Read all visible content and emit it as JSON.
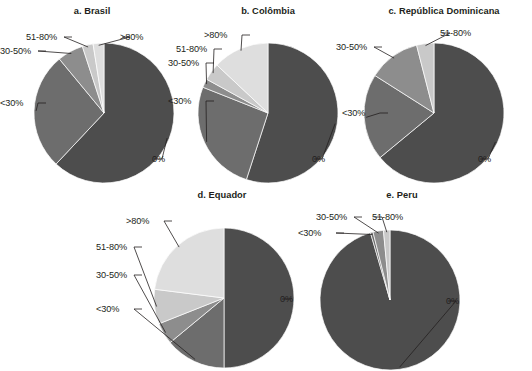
{
  "figure": {
    "cut_title_fragment": "",
    "legend_categories": [
      "0%",
      "<30%",
      "30-50%",
      "51-80%",
      ">80%"
    ],
    "colors": {
      "0%": "#4d4d4d",
      "<30%": "#6d6d6d",
      "30-50%": "#8d8d8d",
      "51-80%": "#c9c9c9",
      ">80%": "#dedede"
    }
  },
  "chart_data": [
    {
      "type": "pie",
      "title": "a. Brasil",
      "categories": [
        "0%",
        "<30%",
        "30-50%",
        "51-80%",
        ">80%"
      ],
      "values": [
        62,
        27,
        6,
        2.5,
        2.5
      ],
      "labels": [
        "0%",
        "<30%",
        "30-50%",
        "51-80%",
        ">80%"
      ],
      "start_angle": 0,
      "direction": "clockwise"
    },
    {
      "type": "pie",
      "title": "b. Colômbia",
      "categories": [
        "0%",
        "<30%",
        "30-50%",
        "51-80%",
        ">80%"
      ],
      "values": [
        55,
        26,
        2,
        4,
        13
      ],
      "labels": [
        "0%",
        "<30%",
        "30-50%",
        "51-80%",
        ">80%"
      ],
      "start_angle": 0,
      "direction": "clockwise"
    },
    {
      "type": "pie",
      "title": "c. República Dominicana",
      "categories": [
        "0%",
        "<30%",
        "30-50%",
        "51-80%"
      ],
      "values": [
        64,
        20,
        12,
        4
      ],
      "labels": [
        "0%",
        "<30%",
        "30-50%",
        "51-80%"
      ],
      "start_angle": 0,
      "direction": "clockwise"
    },
    {
      "type": "pie",
      "title": "d. Equador",
      "categories": [
        "0%",
        "<30%",
        "30-50%",
        "51-80%",
        ">80%"
      ],
      "values": [
        50,
        14,
        5,
        8,
        23
      ],
      "labels": [
        "0%",
        "<30%",
        "30-50%",
        "51-80%",
        ">80%"
      ],
      "start_angle": 0,
      "direction": "clockwise"
    },
    {
      "type": "pie",
      "title": "e. Peru",
      "categories": [
        "0%",
        "<30%",
        "30-50%",
        "51-80%"
      ],
      "values": [
        95.5,
        0.6,
        2.4,
        1.5
      ],
      "labels": [
        "0%",
        "<30%",
        "30-50%",
        "51-80%"
      ],
      "start_angle": 0,
      "direction": "clockwise"
    }
  ]
}
